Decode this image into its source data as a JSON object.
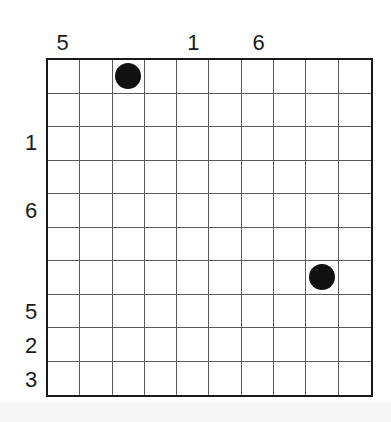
{
  "puzzle": {
    "rows": 10,
    "cols": 10,
    "column_clues": [
      {
        "col": 0,
        "value": "5"
      },
      {
        "col": 4,
        "value": "1"
      },
      {
        "col": 6,
        "value": "6"
      }
    ],
    "row_clues": [
      {
        "row": 2,
        "value": "1"
      },
      {
        "row": 4,
        "value": "6"
      },
      {
        "row": 7,
        "value": "5"
      },
      {
        "row": 8,
        "value": "2"
      },
      {
        "row": 9,
        "value": "3"
      }
    ],
    "discs": [
      {
        "row": 0,
        "col": 2,
        "color": "#111111"
      },
      {
        "row": 6,
        "col": 8,
        "color": "#111111"
      }
    ],
    "colors": {
      "grid_border": "#1a1a1a",
      "grid_line": "#5a5a5a",
      "disc": "#111111",
      "clue_text": "#1a1a1a",
      "background": "#ffffff"
    }
  }
}
